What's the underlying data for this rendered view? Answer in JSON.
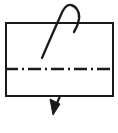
{
  "figure": {
    "type": "technical-line-drawing",
    "title": "",
    "caption": "",
    "width": 118,
    "height": 133,
    "background_color": "#ffffff",
    "stroke_color": "#1a1a1a",
    "elements": [
      {
        "name": "rectangle-outline",
        "shape": "rectangle",
        "x": 5,
        "y": 22,
        "width": 108,
        "height": 74,
        "stroke_width": 2,
        "fill": "none",
        "line_style": "solid"
      },
      {
        "name": "centerline",
        "shape": "horizontal-line",
        "x1": 5,
        "x2": 113,
        "y": 69,
        "stroke_width": 2.4,
        "line_style": "dash-dot",
        "dash_pattern": "13 4 2 4"
      },
      {
        "name": "thread-loop",
        "shape": "open-curve",
        "description": "cursive f-shaped loop crossing the top edge",
        "start_x": 42,
        "start_y": 58,
        "peak_x": 69,
        "peak_y": 5,
        "end_x": 78,
        "end_y": 30,
        "stroke_width": 2.2,
        "fill": "none"
      },
      {
        "name": "direction-arrow",
        "shape": "arrow",
        "description": "short arrow below bottom edge pointing down-left",
        "tail_x": 59,
        "tail_y": 96,
        "tip_x": 53,
        "tip_y": 114,
        "stroke_width": 2,
        "head_style": "filled-triangle"
      }
    ]
  },
  "colors": {
    "ink": "#1a1a1a",
    "paper": "#ffffff"
  }
}
